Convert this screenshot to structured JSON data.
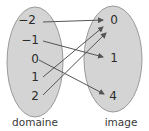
{
  "diagram": {
    "type": "mapping-diagram",
    "colors": {
      "ellipse_fill": "#d4d4d4",
      "ellipse_stroke": "#9a9a9a",
      "arrow": "#555555",
      "text": "#2b2b2b"
    },
    "domain": {
      "caption": "domaine",
      "elements": [
        "−2",
        "−1",
        "0",
        "1",
        "2"
      ]
    },
    "image": {
      "caption": "image",
      "elements": [
        "0",
        "1",
        "4"
      ]
    },
    "mappings": [
      {
        "from": "−2",
        "to": "0"
      },
      {
        "from": "−1",
        "to": "1"
      },
      {
        "from": "0",
        "to": "4"
      },
      {
        "from": "1",
        "to": "0"
      },
      {
        "from": "2",
        "to": "0"
      }
    ]
  }
}
